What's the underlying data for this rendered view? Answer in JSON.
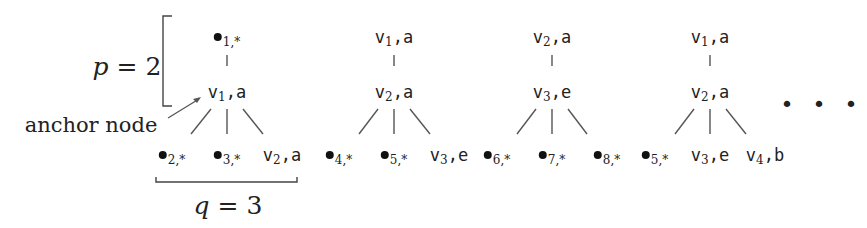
{
  "annotations": {
    "p_label": "p = 2",
    "p_var": "p",
    "p_value": "2",
    "q_label": "q = 3",
    "q_var": "q",
    "q_value": "3",
    "anchor_label": "anchor node",
    "ellipsis": "• • •"
  },
  "trees": [
    {
      "root": {
        "sym": "dot",
        "sub": "1,",
        "tail": "*"
      },
      "anchor": {
        "sym": "v",
        "sub": "1",
        "tail": ",a"
      },
      "children": [
        {
          "sym": "dot",
          "sub": "2,",
          "tail": "*"
        },
        {
          "sym": "dot",
          "sub": "3,",
          "tail": "*"
        },
        {
          "sym": "v",
          "sub": "2",
          "tail": ",a"
        }
      ]
    },
    {
      "root": {
        "sym": "v",
        "sub": "1",
        "tail": ",a"
      },
      "anchor": {
        "sym": "v",
        "sub": "2",
        "tail": ",a"
      },
      "children": [
        {
          "sym": "dot",
          "sub": "4,",
          "tail": "*"
        },
        {
          "sym": "dot",
          "sub": "5,",
          "tail": "*"
        },
        {
          "sym": "v",
          "sub": "3",
          "tail": ",e"
        }
      ]
    },
    {
      "root": {
        "sym": "v",
        "sub": "2",
        "tail": ",a"
      },
      "anchor": {
        "sym": "v",
        "sub": "3",
        "tail": ",e"
      },
      "children": [
        {
          "sym": "dot",
          "sub": "6,",
          "tail": "*"
        },
        {
          "sym": "dot",
          "sub": "7,",
          "tail": "*"
        },
        {
          "sym": "dot",
          "sub": "8,",
          "tail": "*"
        }
      ]
    },
    {
      "root": {
        "sym": "v",
        "sub": "1",
        "tail": ",a"
      },
      "anchor": {
        "sym": "v",
        "sub": "2",
        "tail": ",a"
      },
      "children": [
        {
          "sym": "dot",
          "sub": "5,",
          "tail": "*"
        },
        {
          "sym": "v",
          "sub": "3",
          "tail": ",e"
        },
        {
          "sym": "v",
          "sub": "4",
          "tail": ",b"
        }
      ]
    }
  ]
}
